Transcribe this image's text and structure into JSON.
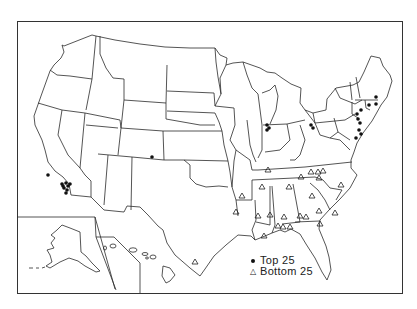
{
  "map": {
    "title": "",
    "frame": {
      "x": 17,
      "y": 21,
      "w": 385,
      "h": 272
    },
    "legend": {
      "items": [
        {
          "symbol": "dot",
          "label": "Top 25"
        },
        {
          "symbol": "triangle",
          "label": "Bottom 25"
        }
      ]
    },
    "points": {
      "top25": [
        [
          152,
          157
        ],
        [
          48,
          175
        ],
        [
          62,
          184
        ],
        [
          63,
          186
        ],
        [
          66,
          183
        ],
        [
          68,
          186
        ],
        [
          64,
          188
        ],
        [
          67,
          190
        ],
        [
          70,
          184
        ],
        [
          66,
          193
        ],
        [
          267,
          125
        ],
        [
          269,
          128
        ],
        [
          267,
          130
        ],
        [
          311,
          125
        ],
        [
          313,
          128
        ],
        [
          361,
          110
        ],
        [
          369,
          105
        ],
        [
          376,
          104
        ],
        [
          357,
          114
        ],
        [
          358,
          119
        ],
        [
          360,
          123
        ],
        [
          359,
          130
        ],
        [
          361,
          134
        ],
        [
          356,
          138
        ],
        [
          376,
          97
        ]
      ],
      "bottom25": [
        [
          268,
          170
        ],
        [
          301,
          177
        ],
        [
          311,
          172
        ],
        [
          318,
          172
        ],
        [
          323,
          171
        ],
        [
          319,
          178
        ],
        [
          262,
          187
        ],
        [
          289,
          187
        ],
        [
          312,
          196
        ],
        [
          341,
          185
        ],
        [
          242,
          196
        ],
        [
          319,
          211
        ],
        [
          306,
          217
        ],
        [
          335,
          213
        ],
        [
          320,
          224
        ],
        [
          236,
          212
        ],
        [
          258,
          216
        ],
        [
          270,
          215
        ],
        [
          284,
          217
        ],
        [
          300,
          216
        ],
        [
          278,
          226
        ],
        [
          283,
          227
        ],
        [
          290,
          227
        ],
        [
          264,
          236
        ],
        [
          195,
          262
        ]
      ]
    }
  }
}
